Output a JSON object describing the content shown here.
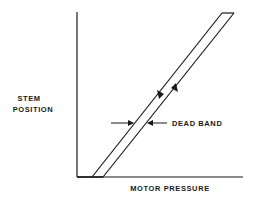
{
  "diagram": {
    "type": "hysteresis-plot",
    "y_axis_label_line1": "STEM",
    "y_axis_label_line2": "POSITION",
    "x_axis_label": "MOTOR PRESSURE",
    "annotation": "DEAD BAND",
    "colors": {
      "line": "#1a1a1a",
      "background": "#ffffff"
    },
    "band": {
      "left_line": {
        "from": [
          92,
          177
        ],
        "to": [
          222,
          13
        ],
        "direction": "decreasing"
      },
      "right_line": {
        "from": [
          103,
          177
        ],
        "to": [
          234,
          13
        ],
        "direction": "increasing"
      }
    }
  }
}
